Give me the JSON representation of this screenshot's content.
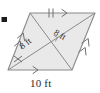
{
  "figure": {
    "type": "geometry-diagram",
    "shape": "parallelogram-with-diagonals",
    "fill_color": "#e9e9e9",
    "stroke_color": "#8a8a8a",
    "text_color": "#2b2b2b",
    "background_color": "#ffffff",
    "bullet_marker": {
      "name": "bullet-marker",
      "color": "#1c1c1c",
      "x": 2,
      "y": 17,
      "width": 5,
      "height": 5
    },
    "vertices": {
      "top_left": {
        "x": 30,
        "y": 13
      },
      "top_right": {
        "x": 95,
        "y": 13
      },
      "bottom_right": {
        "x": 72,
        "y": 70
      },
      "bottom_left": {
        "x": 8,
        "y": 70
      }
    },
    "labels": {
      "base": "10 ft",
      "diagonal_left": "8 ft",
      "diagonal_right": "8 ft"
    },
    "measurements": [
      {
        "segment": "bottom-side",
        "value": 10,
        "unit": "ft",
        "text": "10 ft"
      },
      {
        "segment": "diagonal-half-lower-left",
        "value": 8,
        "unit": "ft",
        "text": "8 ft"
      },
      {
        "segment": "diagonal-half-upper-right",
        "value": 8,
        "unit": "ft",
        "text": "8 ft"
      }
    ],
    "marks": {
      "top_side_ticks": 2,
      "left_diagonal_ticks": 1,
      "top_side_arrows": 1,
      "bottom_side_arrows": 1,
      "left_side_arrows": 2,
      "right_side_arrows": 2,
      "right_angle_mark": true
    }
  }
}
